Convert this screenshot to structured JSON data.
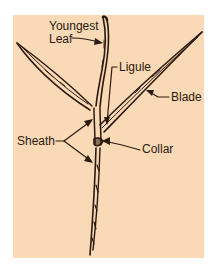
{
  "diagram": {
    "background_color": "#f9d9b6",
    "line_color": "#2b1a10",
    "labels": {
      "youngest_leaf_line1": "Youngest",
      "youngest_leaf_line2": "Leaf",
      "ligule": "Ligule",
      "blade": "Blade",
      "sheath": "Sheath",
      "collar": "Collar"
    }
  }
}
